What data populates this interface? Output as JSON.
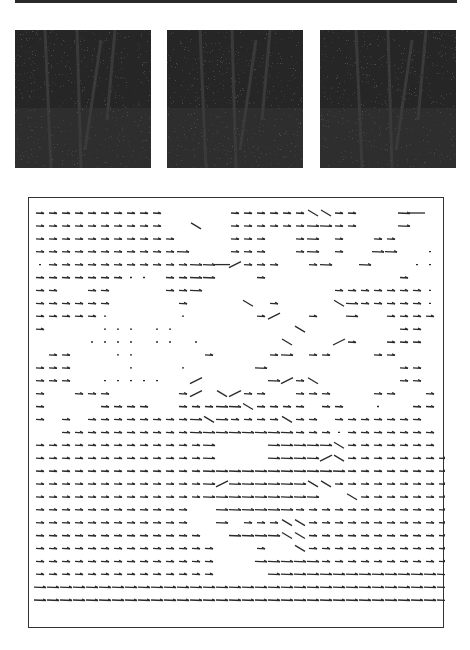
{
  "figure": {
    "frames": [
      {
        "id": "frame-1",
        "description": "dark grayscale image of trees/trunk in forest, frame 1"
      },
      {
        "id": "frame-2",
        "description": "dark grayscale image of trees/trunk in forest, frame 2"
      },
      {
        "id": "frame-3",
        "description": "dark grayscale image of trees/trunk in forest, frame 3"
      }
    ],
    "flow_field": {
      "description": "optical flow vector field, predominantly rightward arrows",
      "grid": {
        "cols": 31,
        "rows": 32,
        "x0": 11,
        "y0": 15,
        "dx": 13,
        "dy": 12.9
      },
      "legend_codes": {
        ".": "empty",
        "d": "dot",
        "s": "short-right",
        "m": "medium-right",
        "l": "long-right",
        "u": "up-right",
        "w": "down-right"
      },
      "rows": [
        "ssssssssss.....sssssswwss...ml.",
        "ssssssssss..w..ssssssmmss...m..",
        "sssssssssss....sss..sm.s..ss...",
        "sssssssssssm...sss..sm.s..mm..d",
        "dsssssssssssmmlusss..sm..m...dd",
        "sssssssdd.ssmm...s..........s..",
        "ss..ss....ssm..........sssssssd",
        "ssssss.....s....w.s....wmsssssd",
        "sssssd.....d.....su..s..m..ssss",
        "s....ddd.dd.........w.......ss.",
        "....dddd.dd.d......w...us..sss.",
        ".ss...dd.....s....sm.ss...ss...",
        "sss....d...d.....m..........ss.",
        "sss..ddddd..u.....musw......ss.",
        "s..sss.....su.wuss..sss...ss..s",
        "s....ssss..sssmmwssss.ss..d..ss",
        "s.s.ssssssssmwmsssswss.sssssss.",
        "..ssssssssssmmmmmmmmsssdsssssss",
        "sssssssssssssm....mmmmmwsssssss",
        "sssssssssssssm....mmmmuwssssssss",
        "sssssssssssssmmmmmmmmmmmssssssss",
        "sssssssssssssmummmmmmwwsssssssss",
        "sssssssssssssmmmmmmmmm..wsssssss",
        "ssssssssssss..mmmmmmssssssssssss",
        "ssssssssssss..m.ssswwsssssssssss",
        "sssssssssssss..mmmmwwsssssssssss",
        "ssssssssssssss...s..wsssssssssss",
        "ssssssssssssss...mmmmmssssssssss",
        "ssssssssssssss....mmmmmmmmmmmmmm",
        "mmmmmmmmmmmmmmmmmmmmmmmmmmmmmmmm",
        "mmmmmmmmmmmmmmmmmmmmmmmmmmmmmmmm"
      ]
    },
    "colors": {
      "frame_bg": "#262626",
      "arrow": "#2b2b2b",
      "border": "#333333",
      "rule": "#2a2a2a"
    }
  }
}
